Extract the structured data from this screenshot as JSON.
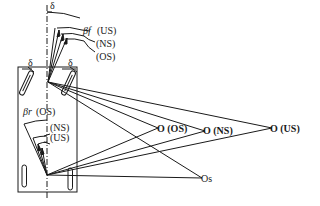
{
  "diagram": {
    "type": "vehicle-steering-geometry",
    "angle_labels": {
      "delta_top": "δ",
      "delta_left_wheel": "δ",
      "delta_right_wheel": "δ",
      "beta_front": "βf",
      "beta_rear": "βr"
    },
    "front_slip_labels": [
      "(US)",
      "(NS)",
      "(OS)"
    ],
    "rear_slip_labels": [
      "(OS)",
      "(NS)",
      "(US)"
    ],
    "centers": [
      {
        "id": "os",
        "label": "O (OS)"
      },
      {
        "id": "ns",
        "label": "O (NS)"
      },
      {
        "id": "us",
        "label": "O (US)"
      },
      {
        "id": "s",
        "label": "Os"
      }
    ],
    "color": "#1a1a1a"
  }
}
